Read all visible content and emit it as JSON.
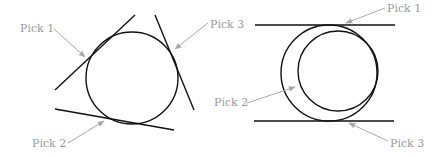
{
  "figure": {
    "left": {
      "labels": [
        "Pick 1",
        "Pick 2",
        "Pick 3"
      ]
    },
    "right": {
      "labels": [
        "Pick 1",
        "Pick 2",
        "Pick 3"
      ]
    }
  }
}
